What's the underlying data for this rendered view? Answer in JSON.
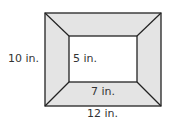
{
  "diagram": {
    "type": "picture-frame",
    "colors": {
      "frame_fill": "#e4e4e4",
      "stroke": "#222222",
      "inner_fill": "#ffffff"
    },
    "labels": {
      "outer_height": "10 in.",
      "inner_height": "5 in.",
      "inner_width": "7 in.",
      "outer_width": "12 in."
    }
  }
}
